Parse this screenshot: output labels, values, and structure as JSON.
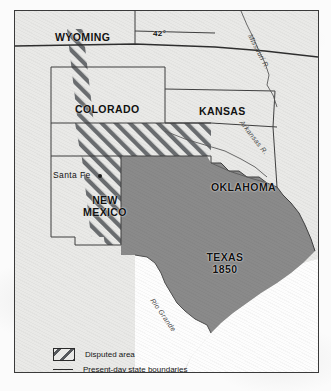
{
  "map": {
    "title": "Texas 1850 and the Disputed Area",
    "frame": {
      "border_color": "#3a3a3a",
      "background_color": "#e9e9e7"
    },
    "states": [
      {
        "name": "WYOMING",
        "x": 40,
        "y": 20,
        "lines": [
          "WYOMING"
        ]
      },
      {
        "name": "COLORADO",
        "x": 60,
        "y": 92,
        "lines": [
          "COLORADO"
        ]
      },
      {
        "name": "KANSAS",
        "x": 184,
        "y": 94,
        "lines": [
          "KANSAS"
        ]
      },
      {
        "name": "OKLAHOMA",
        "x": 196,
        "y": 170,
        "lines": [
          "OKLAHOMA"
        ]
      },
      {
        "name": "NEW MEXICO",
        "x": 62,
        "y": 183,
        "lines": [
          "NEW",
          "MEXICO"
        ]
      },
      {
        "name": "TEXAS 1850",
        "x": 182,
        "y": 240,
        "lines": [
          "TEXAS",
          "1850"
        ]
      }
    ],
    "cities": [
      {
        "name": "Santa Fe",
        "label": "Santa Fe",
        "x": 52,
        "y": 163,
        "dot_x": 97,
        "dot_y": 166
      }
    ],
    "latitude_labels": [
      {
        "label": "42°",
        "x": 152,
        "y": 28
      }
    ],
    "rivers": [
      {
        "name": "Missouri R.",
        "label": "Missouri R.",
        "x": 252,
        "y": 30,
        "rotate": 62
      },
      {
        "name": "Arkansas R.",
        "label": "Arkansas R.",
        "x": 243,
        "y": 118,
        "rotate": 52
      },
      {
        "name": "Rio Grande",
        "label": "Rio Grande",
        "x": 154,
        "y": 296,
        "rotate": 55
      }
    ],
    "fills": {
      "texas_claim_color": "#8a8a8a",
      "disputed_hatch_color": "#6a6d70",
      "land_color": "#e9e9e7",
      "water_color": "#fdfdfd"
    },
    "legend": [
      {
        "symbol": "hatch-swatch",
        "label": "Disputed area"
      },
      {
        "symbol": "line-swatch",
        "label": "Present-day state boundaries"
      }
    ]
  }
}
